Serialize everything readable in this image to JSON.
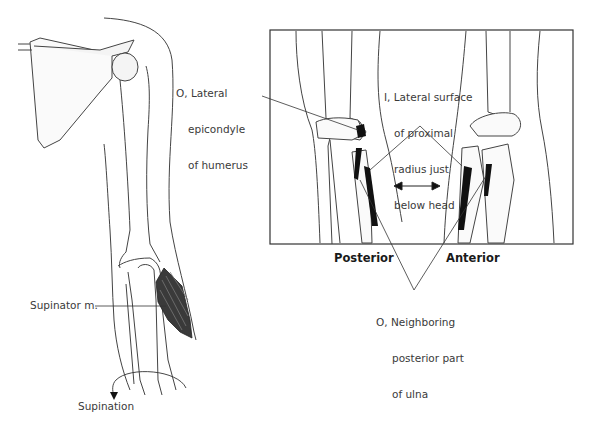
{
  "figure": {
    "left_panel": {
      "muscle_label": "Supinator m.",
      "motion_label": "Supination",
      "origin_label": [
        "O, Lateral",
        "epicondyle",
        "of humerus"
      ]
    },
    "right_panel": {
      "insertion_label": [
        "I, Lateral surface",
        "of proximal",
        "radius just",
        "below head"
      ],
      "view_posterior": "Posterior",
      "view_anterior": "Anterior",
      "ulna_origin_label": [
        "O, Neighboring",
        "posterior part",
        "of ulna"
      ]
    },
    "colors": {
      "line": "#3a3a3a",
      "muscle": "#2b2b2b",
      "attachment": "#111111",
      "bone_shade": "#d8d8d8"
    }
  }
}
